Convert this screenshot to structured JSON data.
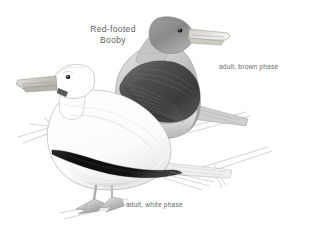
{
  "plate": {
    "width": 309,
    "height": 237,
    "background_color": "#ffffff",
    "medium": "grayscale pencil / wash field-guide illustration"
  },
  "title": {
    "line1": "Red-footed",
    "line2": "Booby",
    "full": "Red-footed Booby",
    "color": "#5e5e5e"
  },
  "labels": {
    "brown_phase": "adult, brown phase",
    "white_phase": "adult, white phase",
    "color": "#6a6a6a"
  },
  "subjects": [
    {
      "name": "brown-phase-booby",
      "label": "adult, brown phase",
      "position": "rear, upper right",
      "facing": "right",
      "head_color": "#8d8d8d",
      "body_color": "#b9b9b9",
      "wing_color": "#4a4a4a",
      "bill_color": "#d8d6d0",
      "eye_color": "#1c1c1c"
    },
    {
      "name": "white-phase-booby",
      "label": "adult, white phase",
      "position": "front, lower left",
      "facing": "left",
      "head_color": "#ffffff",
      "body_color": "#fafafa",
      "wing_stripe_color": "#111111",
      "bill_color": "#c9c7c0",
      "eye_color": "#1c1c1c",
      "feet": "webbed, pale gray"
    }
  ],
  "perch": {
    "name": "branch",
    "color": "#bdbdbd",
    "description": "thin twig lines crossing behind and below both birds"
  }
}
